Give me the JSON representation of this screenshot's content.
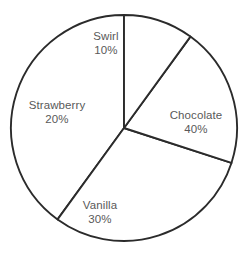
{
  "chart_data": {
    "type": "pie",
    "title": "",
    "subtitle": "",
    "xlabel": "",
    "ylabel": "",
    "categories": [
      "Chocolate",
      "Vanilla",
      "Strawberry",
      "Swirl"
    ],
    "values": [
      40,
      30,
      20,
      10
    ],
    "value_unit": "%",
    "legend": "none",
    "grid": false,
    "slices": [
      {
        "name": "Chocolate",
        "value": 40,
        "label_name": "Chocolate",
        "label_value": "40%",
        "start_angle_deg": 144,
        "end_angle_deg": 360,
        "label_x": 196,
        "label_y": 122,
        "fill": "#ffffff",
        "stroke": "#2b2b2b"
      },
      {
        "name": "Vanilla",
        "value": 30,
        "label_name": "Vanilla",
        "label_value": "30%",
        "start_angle_deg": 252,
        "end_angle_deg": 360,
        "label_x": 100,
        "label_y": 212,
        "fill": "#ffffff",
        "stroke": "#2b2b2b"
      },
      {
        "name": "Strawberry",
        "value": 20,
        "label_name": "Strawberry",
        "label_value": "20%",
        "start_angle_deg": 36,
        "end_angle_deg": 108,
        "label_x": 57,
        "label_y": 112,
        "fill": "#ffffff",
        "stroke": "#2b2b2b"
      },
      {
        "name": "Swirl",
        "value": 10,
        "label_name": "Swirl",
        "label_value": "10%",
        "start_angle_deg": 0,
        "end_angle_deg": 36,
        "label_x": 106,
        "label_y": 43,
        "fill": "#ffffff",
        "stroke": "#2b2b2b"
      }
    ],
    "geometry": {
      "center_x": 124,
      "center_y": 128,
      "radius": 113,
      "direction": "counterclockwise",
      "start_reference": "12-oclock"
    },
    "colors": {
      "background": "#ffffff",
      "outline": "#2b2b2b",
      "text": "#595959"
    }
  }
}
